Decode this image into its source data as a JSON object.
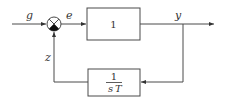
{
  "diagram": {
    "type": "block-diagram",
    "signals": {
      "input": "g",
      "error": "e",
      "output": "y",
      "feedback": "z"
    },
    "blocks": {
      "forward": {
        "label": "1"
      },
      "feedback": {
        "numerator": "1",
        "denominator_s": "s",
        "denominator_T": "T"
      }
    },
    "summing_junction": {
      "inputs": [
        "+ g (left)",
        "- z (bottom)"
      ]
    },
    "colors": {
      "line": "#4a4a4a",
      "text": "#333333",
      "background": "#ffffff"
    }
  }
}
